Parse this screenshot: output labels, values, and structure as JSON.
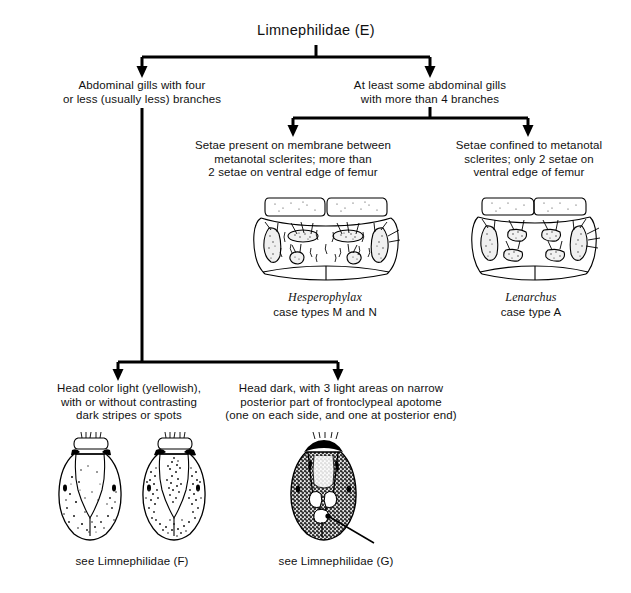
{
  "diagram": {
    "title": "Limnephilidae (E)",
    "type": "dichotomous-taxonomic-key"
  },
  "branches": {
    "left_gills": "Abdominal gills with four\nor less (usually less) branches",
    "right_gills": "At least some abdominal gills\nwith more than 4 branches",
    "setae_membrane": "Setae present on membrane between\nmetanotal sclerites; more than\n2 setae on ventral edge of femur",
    "setae_confined": "Setae confined to metanotal\nsclerites; only 2 setae on\nventral edge of femur",
    "head_light": "Head color light (yellowish),\nwith or without contrasting\ndark stripes or spots",
    "head_dark": "Head dark, with 3 light areas on narrow\nposterior part of frontoclypeal apotome\n(one on each side, and one at posterior end)"
  },
  "taxa": {
    "hesperophylax": {
      "genus": "Hesperophylax",
      "case_type": "case types M and N"
    },
    "lenarchus": {
      "genus": "Lenarchus",
      "case_type": "case type A"
    }
  },
  "references": {
    "limnephilidae_f": "see Limnephilidae (F)",
    "limnephilidae_g": "see Limnephilidae (G)"
  },
  "figures": {
    "metanotum_hesperophylax": "metanotum-with-membrane-setae-illustration",
    "metanotum_lenarchus": "metanotum-setae-confined-illustration",
    "head_light_left": "light-head-capsule-dorsal-illustration",
    "head_light_right": "light-head-capsule-striped-dorsal-illustration",
    "head_dark": "dark-head-capsule-dorsal-illustration"
  },
  "colors": {
    "ink": "#000000",
    "background": "#ffffff",
    "text": "#111111"
  }
}
